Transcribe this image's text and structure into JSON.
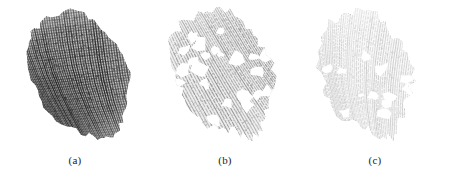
{
  "figure": {
    "background_color": "#ffffff",
    "panel_count": 3
  },
  "panels": [
    {
      "id": "a",
      "caption": "(a)",
      "image_name": "fingerprint-original",
      "ink_color": "#141414",
      "tone": "dark",
      "rotation_deg": -26,
      "center_x": 80,
      "center_y": 76,
      "radius_x": 47,
      "radius_y": 68,
      "ridge_spacing": 2.0,
      "ridge_angle_deg": 72,
      "hole_count": 0,
      "edge_style": "soft",
      "core_darkness": 0.95
    },
    {
      "id": "b",
      "caption": "(b)",
      "image_name": "fingerprint-binarized",
      "ink_color": "#2e2e2e",
      "tone": "medium",
      "rotation_deg": -26,
      "center_x": 74,
      "center_y": 74,
      "radius_x": 48,
      "radius_y": 66,
      "ridge_spacing": 2.4,
      "ridge_angle_deg": 60,
      "hole_count": 34,
      "edge_style": "ragged",
      "core_darkness": 0.55
    },
    {
      "id": "c",
      "caption": "(c)",
      "image_name": "fingerprint-thinned",
      "ink_color": "#555555",
      "tone": "light",
      "rotation_deg": -20,
      "center_x": 66,
      "center_y": 74,
      "radius_x": 45,
      "radius_y": 64,
      "ridge_spacing": 1.8,
      "ridge_angle_deg": 88,
      "hole_count": 16,
      "edge_style": "ragged",
      "core_darkness": 0.35
    }
  ]
}
